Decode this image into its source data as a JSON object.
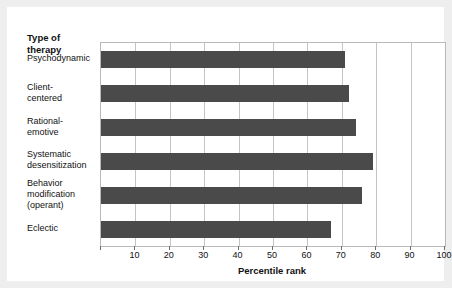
{
  "chart_data": {
    "type": "bar",
    "orientation": "horizontal",
    "title": "",
    "category_axis_title": "Type of therapy",
    "xlabel": "Percentile rank",
    "ylabel": "",
    "xlim": [
      0,
      100
    ],
    "xticks": [
      0,
      10,
      20,
      30,
      40,
      50,
      60,
      70,
      80,
      90,
      100
    ],
    "xtick_labels": [
      "",
      "10",
      "20",
      "30",
      "40",
      "50",
      "60",
      "70",
      "80",
      "90",
      "100"
    ],
    "grid": true,
    "grid_axis": "x",
    "legend": null,
    "bar_color": "#4a4a4a",
    "categories": [
      "Psychodynamic",
      "Client-centered",
      "Rational-emotive",
      "Systematic desensitization",
      "Behavior modification (operant)",
      "Eclectic"
    ],
    "category_label_lines": [
      [
        "Psychodynamic"
      ],
      [
        "Client-",
        "centered"
      ],
      [
        "Rational-",
        "emotive"
      ],
      [
        "Systematic",
        "desensitization"
      ],
      [
        "Behavior",
        "modification",
        "(operant)"
      ],
      [
        "Eclectic"
      ]
    ],
    "values": [
      71,
      72,
      74,
      79,
      76,
      67
    ]
  },
  "colors": {
    "page_background": "#eeeeee",
    "figure_background": "#ffffff",
    "bar": "#4a4a4a",
    "gridline": "#c4c4c4",
    "axis_frame": "#b9b9b9",
    "text": "#111111"
  }
}
